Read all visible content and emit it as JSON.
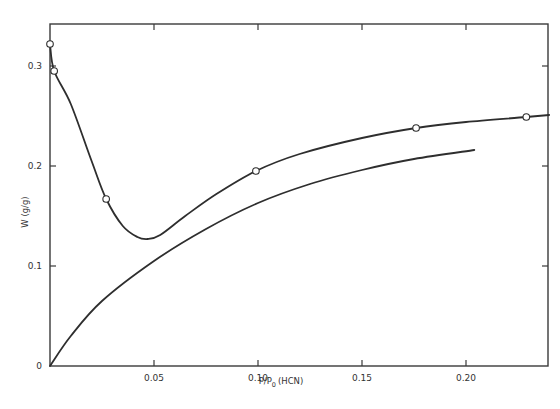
{
  "chart_data": {
    "type": "line",
    "title": "",
    "xlabel": "P/P0 (HCN)",
    "xlabel_main": "P/P",
    "xlabel_sub": "0",
    "xlabel_suffix": "(HCN)",
    "ylabel": "W (g/g)",
    "xlim": [
      0,
      0.24
    ],
    "ylim": [
      0,
      0.34
    ],
    "grid": false,
    "legend": null,
    "x_ticks": [
      {
        "value": 0.05,
        "label": "0.05"
      },
      {
        "value": 0.1,
        "label": "0.10"
      },
      {
        "value": 0.15,
        "label": "0.15"
      },
      {
        "value": 0.2,
        "label": "0.20"
      }
    ],
    "y_ticks": [
      {
        "value": 0,
        "label": "0"
      },
      {
        "value": 0.1,
        "label": "0.1"
      },
      {
        "value": 0.2,
        "label": "0.2"
      },
      {
        "value": 0.3,
        "label": "0.3"
      }
    ],
    "series": [
      {
        "name": "upper curve (with data points)",
        "markers": "open-circle",
        "points": [
          {
            "x": 0.0,
            "y": 0.322
          },
          {
            "x": 0.002,
            "y": 0.295
          },
          {
            "x": 0.027,
            "y": 0.167
          },
          {
            "x": 0.099,
            "y": 0.195
          },
          {
            "x": 0.176,
            "y": 0.238
          },
          {
            "x": 0.229,
            "y": 0.249
          }
        ],
        "curve": [
          {
            "x": 0.0,
            "y": 0.322
          },
          {
            "x": 0.002,
            "y": 0.295
          },
          {
            "x": 0.01,
            "y": 0.262
          },
          {
            "x": 0.02,
            "y": 0.205
          },
          {
            "x": 0.027,
            "y": 0.167
          },
          {
            "x": 0.035,
            "y": 0.14
          },
          {
            "x": 0.042,
            "y": 0.129
          },
          {
            "x": 0.047,
            "y": 0.127
          },
          {
            "x": 0.053,
            "y": 0.131
          },
          {
            "x": 0.065,
            "y": 0.15
          },
          {
            "x": 0.08,
            "y": 0.172
          },
          {
            "x": 0.099,
            "y": 0.195
          },
          {
            "x": 0.12,
            "y": 0.212
          },
          {
            "x": 0.15,
            "y": 0.228
          },
          {
            "x": 0.176,
            "y": 0.238
          },
          {
            "x": 0.2,
            "y": 0.244
          },
          {
            "x": 0.229,
            "y": 0.249
          },
          {
            "x": 0.24,
            "y": 0.251
          }
        ]
      },
      {
        "name": "lower curve",
        "markers": "none",
        "curve": [
          {
            "x": 0.0,
            "y": 0.0
          },
          {
            "x": 0.01,
            "y": 0.03
          },
          {
            "x": 0.025,
            "y": 0.065
          },
          {
            "x": 0.05,
            "y": 0.105
          },
          {
            "x": 0.075,
            "y": 0.137
          },
          {
            "x": 0.1,
            "y": 0.163
          },
          {
            "x": 0.125,
            "y": 0.182
          },
          {
            "x": 0.15,
            "y": 0.196
          },
          {
            "x": 0.175,
            "y": 0.207
          },
          {
            "x": 0.204,
            "y": 0.216
          }
        ]
      }
    ]
  }
}
